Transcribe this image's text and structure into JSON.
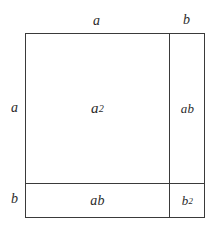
{
  "diagram": {
    "type": "geometric-area-model",
    "identity": "(a + b)^2 = a^2 + 2ab + b^2",
    "outer_shape": "square",
    "colors": {
      "background": "#ffffff",
      "stroke": "#3a3a3a",
      "text": "#2b2b2b"
    },
    "edge_labels": {
      "top_left_segment": "a",
      "top_right_segment": "b",
      "left_upper_segment": "a",
      "left_lower_segment": "b"
    },
    "regions": [
      {
        "id": "top-left",
        "base": "a",
        "exponent": "2",
        "label": "a²",
        "meaning": "a squared"
      },
      {
        "id": "top-right",
        "base": "ab",
        "exponent": "",
        "label": "ab",
        "meaning": "a times b"
      },
      {
        "id": "bottom-left",
        "base": "ab",
        "exponent": "",
        "label": "ab",
        "meaning": "a times b"
      },
      {
        "id": "bottom-right",
        "base": "b",
        "exponent": "2",
        "label": "b²",
        "meaning": "b squared"
      }
    ]
  }
}
